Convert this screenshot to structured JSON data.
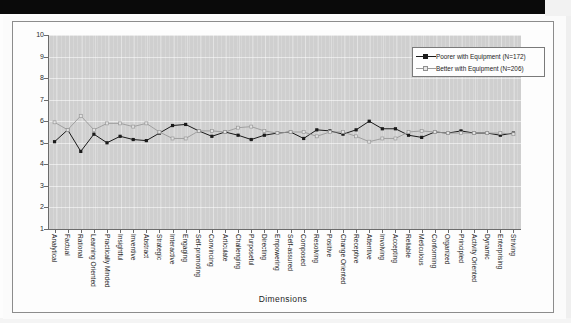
{
  "figure": {
    "axis_title": "Dimensions",
    "colors": {
      "series_poorer": "#1a1a1a",
      "series_better": "#9a9a9a",
      "plot_background": "#cfcfcf",
      "axis_line": "#6b6b6b",
      "gridline": "#ffffff"
    }
  },
  "legend": {
    "entries": [
      {
        "label": "Poorer with Equipment (N=172)",
        "marker": "filled-square",
        "color": "#1a1a1a"
      },
      {
        "label": "Better with Equipment (N=206)",
        "marker": "open-square",
        "color": "#9a9a9a"
      }
    ]
  },
  "chart_data": {
    "type": "line",
    "title": "",
    "subtitle": "",
    "xlabel": "Dimensions",
    "ylabel": "",
    "ylim": [
      1,
      10
    ],
    "yticks": [
      1,
      2,
      3,
      4,
      5,
      6,
      7,
      8,
      9,
      10
    ],
    "ytick_labels": [
      "1",
      "2",
      "3",
      "4",
      "5",
      "6",
      "7",
      "8",
      "9",
      "10"
    ],
    "grid": true,
    "legend_position": "upper-right",
    "categories": [
      "Analytical",
      "Factual",
      "Rational",
      "Learning Oriented",
      "Practically Minded",
      "Insightful",
      "Inventive",
      "Abstract",
      "Strategic",
      "Interactive",
      "Engaging",
      "Self-promoting",
      "Convincing",
      "Articulate",
      "Challenging",
      "Purposeful",
      "Directing",
      "Empowering",
      "Self-assured",
      "Composed",
      "Resolving",
      "Positive",
      "Change Oriented",
      "Receptive",
      "Attentive",
      "Involving",
      "Accepting",
      "Reliable",
      "Meticulous",
      "Conforming",
      "Organized",
      "Principled",
      "Activity Oriented",
      "Dynamic",
      "Enterprising",
      "Striving"
    ],
    "series": [
      {
        "name": "Poorer with Equipment (N=172)",
        "color": "#1a1a1a",
        "marker": "filled-square",
        "values": [
          5.05,
          5.6,
          4.6,
          5.4,
          5.0,
          5.3,
          5.15,
          5.1,
          5.45,
          5.8,
          5.85,
          5.55,
          5.3,
          5.5,
          5.35,
          5.15,
          5.35,
          5.45,
          5.5,
          5.2,
          5.6,
          5.55,
          5.4,
          5.6,
          6.0,
          5.65,
          5.65,
          5.35,
          5.25,
          5.5,
          5.45,
          5.55,
          5.45,
          5.45,
          5.35,
          5.45
        ]
      },
      {
        "name": "Better with Equipment (N=206)",
        "color": "#9a9a9a",
        "marker": "open-square",
        "values": [
          5.95,
          5.6,
          6.25,
          5.6,
          5.9,
          5.9,
          5.75,
          5.9,
          5.5,
          5.2,
          5.2,
          5.55,
          5.55,
          5.5,
          5.7,
          5.75,
          5.55,
          5.45,
          5.5,
          5.5,
          5.3,
          5.5,
          5.5,
          5.3,
          5.05,
          5.2,
          5.2,
          5.5,
          5.55,
          5.5,
          5.45,
          5.45,
          5.45,
          5.45,
          5.45,
          5.4
        ]
      }
    ]
  }
}
